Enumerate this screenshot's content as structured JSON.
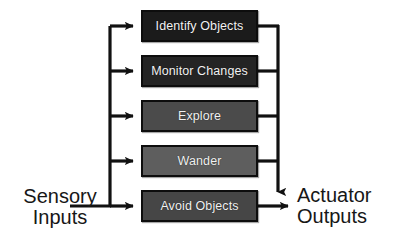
{
  "diagram": {
    "background_color": "#ffffff",
    "line_color": "#111111",
    "input": {
      "line1": "Sensory",
      "line2": "Inputs"
    },
    "output": {
      "line1": "Actuator",
      "line2": "Outputs"
    },
    "layers": [
      {
        "label": "Identify Objects",
        "fill": "#1b1b1b",
        "text_color": "#f2f2f2"
      },
      {
        "label": "Monitor Changes",
        "fill": "#242424",
        "text_color": "#f2f2f2"
      },
      {
        "label": "Explore",
        "fill": "#4b4b4b",
        "text_color": "#f4f4f4"
      },
      {
        "label": "Wander",
        "fill": "#5e5e5e",
        "text_color": "#f6f6f6"
      },
      {
        "label": "Avoid Objects",
        "fill": "#464646",
        "text_color": "#f4f4f4"
      }
    ]
  }
}
